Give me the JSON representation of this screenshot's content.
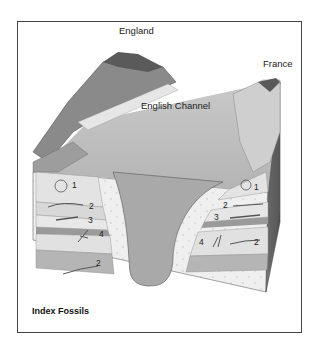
{
  "figure": {
    "caption": "Index Fossils",
    "labels": {
      "england": "England",
      "france": "France",
      "channel": "English Channel"
    },
    "left_cliff_fossils": [
      "1",
      "2",
      "3",
      "4",
      "2"
    ],
    "right_cliff_fossils": [
      "1",
      "2",
      "3",
      "4",
      "2"
    ]
  }
}
